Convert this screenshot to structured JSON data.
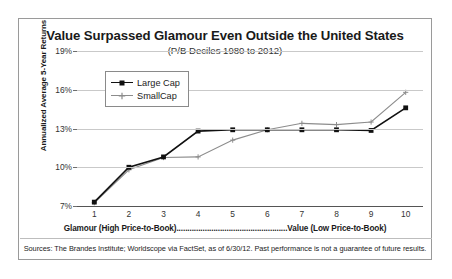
{
  "chart_data": {
    "type": "line",
    "title": "Value Surpassed Glamour Even Outside the United States",
    "subtitle": "(P/B Deciles 1980 to 2012)",
    "xlabel": "Glamour (High Price-to-Book)...................................................Value (Low Price-to-Book)",
    "ylabel": "Annualized Average 5-Year Returns",
    "categories": [
      "1",
      "2",
      "3",
      "4",
      "5",
      "6",
      "7",
      "8",
      "9",
      "10"
    ],
    "yticks": [
      "7%",
      "10%",
      "13%",
      "16%",
      "19%"
    ],
    "ytick_values": [
      7,
      10,
      13,
      16,
      19
    ],
    "ylim": [
      7,
      19
    ],
    "grid": true,
    "legend_position": "upper-left-inside",
    "series": [
      {
        "name": "Large Cap",
        "color": "#111111",
        "marker": "filled-square",
        "values": [
          7.3,
          10.0,
          10.8,
          12.8,
          12.9,
          12.9,
          12.9,
          12.9,
          12.85,
          14.6
        ]
      },
      {
        "name": "SmallCap",
        "color": "#8c8c8c",
        "marker": "plus",
        "values": [
          7.25,
          9.8,
          10.75,
          10.8,
          12.1,
          12.9,
          13.4,
          13.3,
          13.5,
          15.8
        ]
      }
    ]
  },
  "footer": {
    "sources": "Sources: The Brandes Institute; Worldscope via FactSet, as of 6/30/12. Past performance is not a guarantee of future results."
  }
}
